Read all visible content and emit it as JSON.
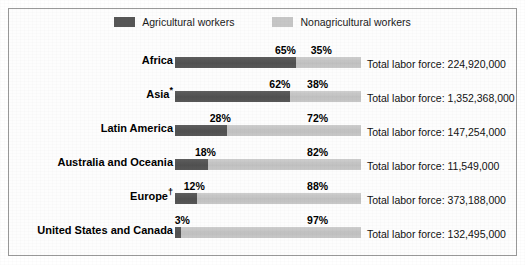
{
  "legend": {
    "items": [
      {
        "label": "Agricultural workers",
        "color": "#565656",
        "icon": "legend-swatch-dark"
      },
      {
        "label": "Nonagricultural workers",
        "color": "#c6c6c6",
        "icon": "legend-swatch-light"
      }
    ]
  },
  "total_prefix": "Total labor force: ",
  "chart_data": {
    "type": "bar",
    "subtype": "stacked-horizontal-100pct",
    "title": "",
    "xlabel": "",
    "ylabel": "",
    "xlim": [
      0,
      100
    ],
    "grid": false,
    "legend_position": "top-center",
    "categories": [
      "Africa",
      "Asia*",
      "Latin America",
      "Australia and Oceania",
      "Europe†",
      "United States and Canada"
    ],
    "series": [
      {
        "name": "Agricultural workers",
        "color": "#565656",
        "values": [
          65,
          62,
          28,
          18,
          12,
          3
        ]
      },
      {
        "name": "Nonagricultural workers",
        "color": "#c6c6c6",
        "values": [
          35,
          38,
          72,
          82,
          88,
          97
        ]
      }
    ],
    "annotations": [
      "Total labor force: 224,920,000",
      "Total labor force: 1,352,368,000",
      "Total labor force: 147,254,000",
      "Total labor force: 11,549,000",
      "Total labor force: 373,188,000",
      "Total labor force: 132,495,000"
    ]
  },
  "rows": [
    {
      "label": "Africa",
      "label_mark": "",
      "ag_pct": 65,
      "nonag_pct": 35,
      "ag_pct_text": "65%",
      "nonag_pct_text": "35%",
      "ag_label_anchor": 65,
      "nonag_label_anchor": 73,
      "total_text": "Total labor force: 224,920,000",
      "total_value": "224,920,000"
    },
    {
      "label": "Asia",
      "label_mark": "*",
      "ag_pct": 62,
      "nonag_pct": 38,
      "ag_pct_text": "62%",
      "nonag_pct_text": "38%",
      "ag_label_anchor": 62,
      "nonag_label_anchor": 71,
      "total_text": "Total labor force: 1,352,368,000",
      "total_value": "1,352,368,000"
    },
    {
      "label": "Latin America",
      "label_mark": "",
      "ag_pct": 28,
      "nonag_pct": 72,
      "ag_pct_text": "28%",
      "nonag_pct_text": "72%",
      "ag_label_anchor": 30,
      "nonag_label_anchor": 71,
      "total_text": "Total labor force: 147,254,000",
      "total_value": "147,254,000"
    },
    {
      "label": "Australia and Oceania",
      "label_mark": "",
      "ag_pct": 18,
      "nonag_pct": 82,
      "ag_pct_text": "18%",
      "nonag_pct_text": "82%",
      "ag_label_anchor": 22,
      "nonag_label_anchor": 71,
      "total_text": "Total labor force: 11,549,000",
      "total_value": "11,549,000"
    },
    {
      "label": "Europe",
      "label_mark": "†",
      "ag_pct": 12,
      "nonag_pct": 88,
      "ag_pct_text": "12%",
      "nonag_pct_text": "88%",
      "ag_label_anchor": 16,
      "nonag_label_anchor": 71,
      "total_text": "Total labor force: 373,188,000",
      "total_value": "373,188,000"
    },
    {
      "label": "United States and Canada",
      "label_mark": "",
      "ag_pct": 3,
      "nonag_pct": 97,
      "ag_pct_text": "3%",
      "nonag_pct_text": "97%",
      "ag_label_anchor": 8,
      "nonag_label_anchor": 71,
      "total_text": "Total labor force: 132,495,000",
      "total_value": "132,495,000"
    }
  ]
}
